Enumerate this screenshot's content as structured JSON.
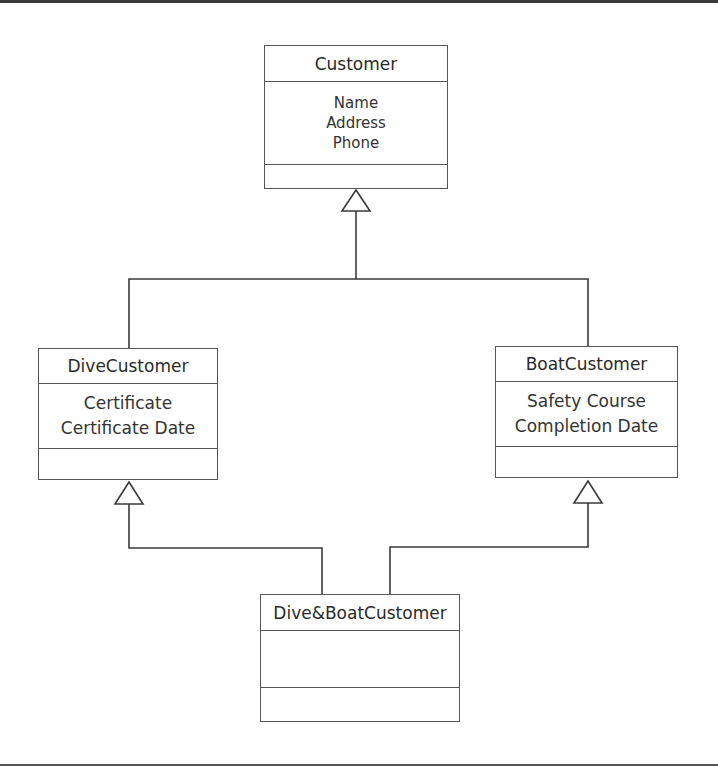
{
  "diagram": {
    "type": "UML class diagram (generalization / multiple inheritance)",
    "classes": {
      "customer": {
        "name": "Customer",
        "attributes": [
          "Name",
          "Address",
          "Phone"
        ],
        "operations": []
      },
      "dive_customer": {
        "name": "DiveCustomer",
        "attributes": [
          "Certificate",
          "Certificate Date"
        ],
        "operations": []
      },
      "boat_customer": {
        "name": "BoatCustomer",
        "attributes": [
          "Safety Course",
          "Completion Date"
        ],
        "operations": []
      },
      "dive_boat_customer": {
        "name": "Dive&BoatCustomer",
        "attributes": [],
        "operations": []
      }
    },
    "relationships": [
      {
        "type": "generalization",
        "child": "DiveCustomer",
        "parent": "Customer"
      },
      {
        "type": "generalization",
        "child": "BoatCustomer",
        "parent": "Customer"
      },
      {
        "type": "generalization",
        "child": "Dive&BoatCustomer",
        "parent": "DiveCustomer"
      },
      {
        "type": "generalization",
        "child": "Dive&BoatCustomer",
        "parent": "BoatCustomer"
      }
    ],
    "colors": {
      "line": "#3a3a3a",
      "box_border": "#555555",
      "text": "#2a2a2a",
      "background": "#ffffff"
    }
  }
}
